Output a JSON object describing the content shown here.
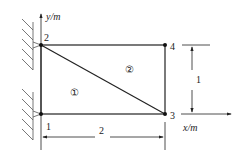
{
  "diagram": {
    "type": "finite-element-mesh",
    "axes": {
      "x_label": "x/m",
      "y_label": "y/m"
    },
    "nodes": [
      {
        "id": "1",
        "label": "1"
      },
      {
        "id": "2",
        "label": "2"
      },
      {
        "id": "3",
        "label": "3"
      },
      {
        "id": "4",
        "label": "4"
      }
    ],
    "elements": [
      {
        "id": "e1",
        "label": "①",
        "nodes": [
          "1",
          "3",
          "2"
        ]
      },
      {
        "id": "e2",
        "label": "②",
        "nodes": [
          "2",
          "3",
          "4"
        ]
      }
    ],
    "dimensions": {
      "width": "2",
      "height": "1"
    },
    "supports": [
      "node-1-pinned",
      "node-2-pinned"
    ],
    "line_color": "#222222"
  }
}
